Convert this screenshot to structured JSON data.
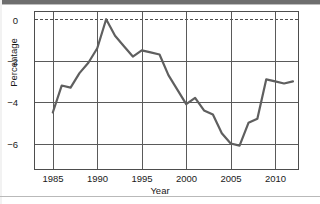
{
  "chart_data": {
    "type": "line",
    "title": "",
    "xlabel": "Year",
    "ylabel": "Percentage",
    "xlim": [
      1983,
      2012.5
    ],
    "ylim": [
      -7.2,
      0.35
    ],
    "xticks": [
      1985,
      1990,
      1995,
      2000,
      2005,
      2010
    ],
    "yticks": [
      0,
      -2,
      -4,
      -6
    ],
    "ytick_labels": [
      "0",
      "−2",
      "−4",
      "−6"
    ],
    "xtick_labels": [
      "1985",
      "1990",
      "1995",
      "2000",
      "2005",
      "2010"
    ],
    "grid": "both",
    "zero_reference_line": true,
    "legend": "none",
    "line_color": "#5f5f5f",
    "frame_color": "#4d4d4d",
    "x": [
      1985,
      1986,
      1987,
      1988,
      1989,
      1990,
      1991,
      1992,
      1993,
      1994,
      1995,
      1996,
      1997,
      1998,
      1999,
      2000,
      2001,
      2002,
      2003,
      2004,
      2005,
      2006,
      2007,
      2008,
      2009,
      2010,
      2011,
      2012
    ],
    "values": [
      -4.5,
      -3.2,
      -3.3,
      -2.6,
      -2.1,
      -1.4,
      0.0,
      -0.8,
      -1.3,
      -1.8,
      -1.5,
      -1.6,
      -1.7,
      -2.7,
      -3.4,
      -4.1,
      -3.8,
      -4.4,
      -4.6,
      -5.5,
      -6.0,
      -6.1,
      -5.0,
      -4.8,
      -2.9,
      -3.0,
      -3.1,
      -3.0
    ]
  },
  "axes": {
    "x_axis_title": "Year",
    "y_axis_title": "Percentage"
  }
}
